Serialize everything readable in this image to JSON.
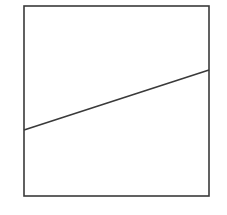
{
  "diagram": {
    "width": 227,
    "height": 215,
    "background": "#ffffff",
    "stroke_color": "#3a3a3a",
    "box": {
      "x": 24,
      "y": 6,
      "width": 185,
      "height": 190,
      "stroke_width": 1.6
    },
    "line": {
      "x1": 24,
      "y1": 130,
      "x2": 209,
      "y2": 70,
      "stroke_width": 1.6
    }
  }
}
